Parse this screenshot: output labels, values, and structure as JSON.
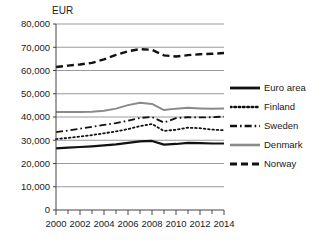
{
  "chart_data": {
    "type": "line",
    "title": "",
    "subtitle": "",
    "unit_label": "EUR",
    "xlabel": "",
    "ylabel": "",
    "xlim": [
      2000,
      2014
    ],
    "ylim": [
      0,
      80000
    ],
    "grid": true,
    "legend_position": "right",
    "x": [
      2000,
      2001,
      2002,
      2003,
      2004,
      2005,
      2006,
      2007,
      2008,
      2009,
      2010,
      2011,
      2012,
      2013,
      2014
    ],
    "x_tick_labels": [
      "2000",
      "2002",
      "2004",
      "2006",
      "2008",
      "2010",
      "2012",
      "2014"
    ],
    "x_tick_values": [
      2000,
      2002,
      2004,
      2006,
      2008,
      2010,
      2012,
      2014
    ],
    "y_tick_labels": [
      "0",
      "10,000",
      "20,000",
      "30,000",
      "40,000",
      "50,000",
      "60,000",
      "70,000",
      "80,000"
    ],
    "y_tick_values": [
      0,
      10000,
      20000,
      30000,
      40000,
      50000,
      60000,
      70000,
      80000
    ],
    "series": [
      {
        "name": "Euro area",
        "style": "solid",
        "color": "#111111",
        "width": 2.2,
        "values": [
          26500,
          26800,
          27100,
          27400,
          27800,
          28200,
          28900,
          29500,
          29700,
          28100,
          28400,
          28900,
          28800,
          28600,
          28600
        ]
      },
      {
        "name": "Finland",
        "style": "dotted",
        "color": "#111111",
        "width": 1.8,
        "values": [
          30500,
          31000,
          31600,
          32200,
          33000,
          33800,
          34800,
          36100,
          37000,
          34000,
          34500,
          35400,
          35200,
          34600,
          34300
        ]
      },
      {
        "name": "Sweden",
        "style": "dashdot",
        "color": "#111111",
        "width": 1.8,
        "values": [
          33500,
          34200,
          35000,
          35800,
          36600,
          37400,
          38400,
          39600,
          40000,
          37600,
          39500,
          39900,
          39800,
          39900,
          40200
        ]
      },
      {
        "name": "Denmark",
        "style": "solid",
        "color": "#8a8a8a",
        "width": 2.0,
        "values": [
          42100,
          42200,
          42200,
          42300,
          42700,
          43600,
          45100,
          46100,
          45600,
          43000,
          43600,
          44000,
          43700,
          43500,
          43700
        ]
      },
      {
        "name": "Norway",
        "style": "dashed",
        "color": "#111111",
        "width": 2.4,
        "values": [
          61500,
          62100,
          62600,
          63300,
          64800,
          66700,
          68300,
          69200,
          68900,
          66500,
          66000,
          66600,
          67000,
          67200,
          67500
        ]
      }
    ]
  },
  "legend": {
    "items": [
      {
        "label": "Euro area"
      },
      {
        "label": "Finland"
      },
      {
        "label": "Sweden"
      },
      {
        "label": "Denmark"
      },
      {
        "label": "Norway"
      }
    ]
  },
  "axes": {
    "unit_label": "EUR"
  }
}
